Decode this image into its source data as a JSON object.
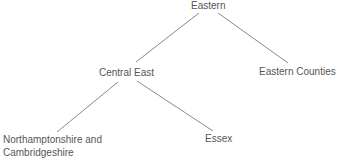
{
  "diagram": {
    "type": "tree",
    "colors": {
      "text": "#555555",
      "edge": "#8a8a8a",
      "background": "#ffffff"
    },
    "nodes": {
      "eastern": {
        "label": "Eastern"
      },
      "central_east": {
        "label": "Central East"
      },
      "eastern_counties": {
        "label": "Eastern Counties"
      },
      "northants_cambs": {
        "line1": "Northamptonshire and",
        "line2": "Cambridgeshire"
      },
      "essex": {
        "label": "Essex"
      }
    },
    "edges": [
      {
        "from": "Eastern",
        "to": "Central East"
      },
      {
        "from": "Eastern",
        "to": "Eastern Counties"
      },
      {
        "from": "Central East",
        "to": "Northamptonshire and Cambridgeshire"
      },
      {
        "from": "Central East",
        "to": "Essex"
      }
    ]
  }
}
